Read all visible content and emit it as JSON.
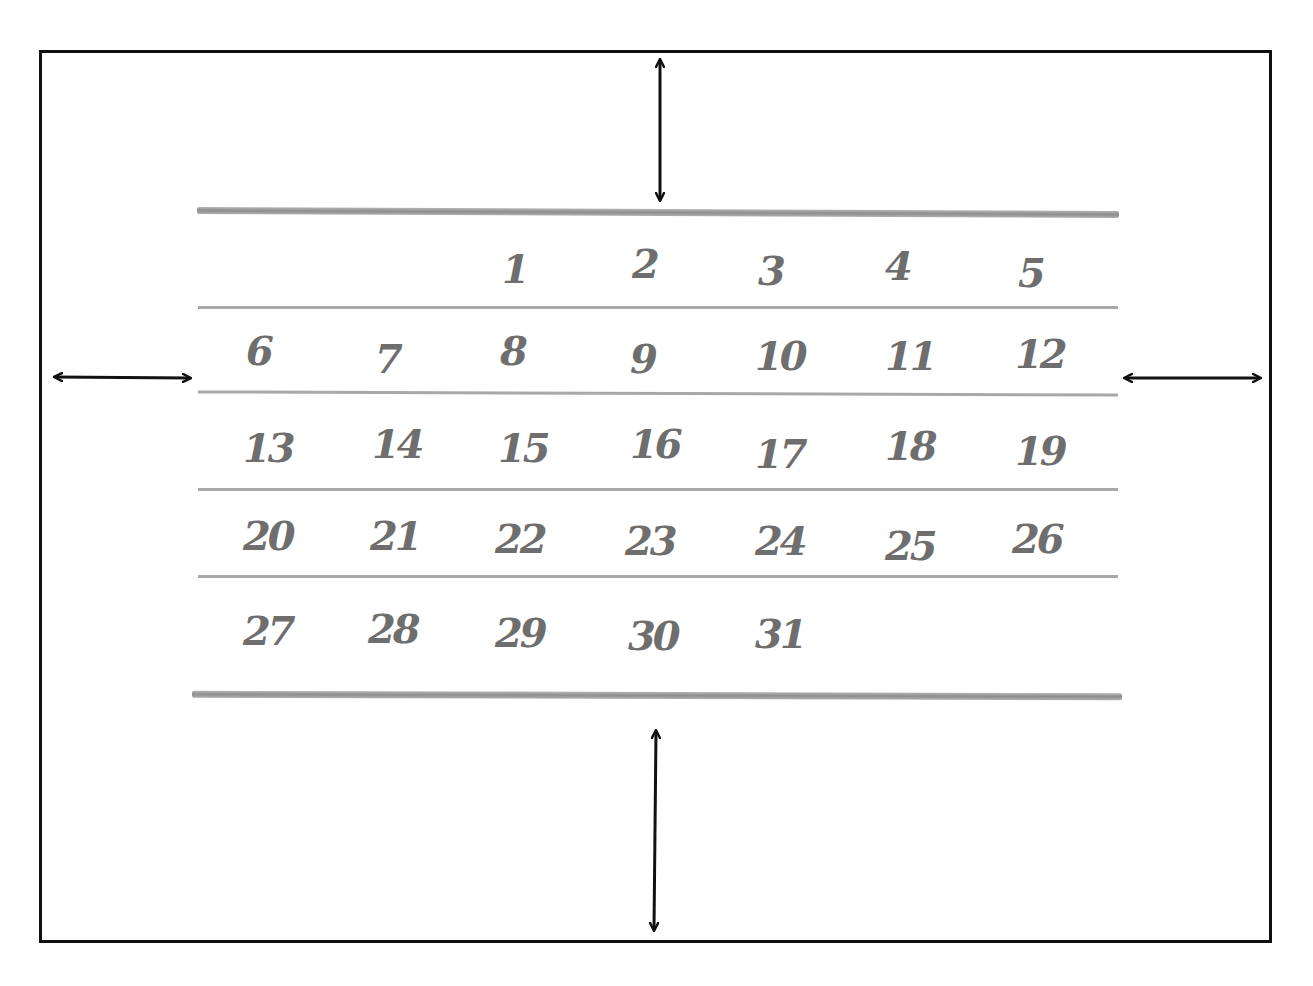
{
  "diagram": {
    "title": "",
    "colors": {
      "frame": "#111111",
      "rules": "#9a9a9a",
      "numerals": "#6e6e6e",
      "arrows": "#111111"
    },
    "calendar": {
      "columns": 7,
      "rows": [
        [
          "",
          "",
          "1",
          "2",
          "3",
          "4",
          "5"
        ],
        [
          "6",
          "7",
          "8",
          "9",
          "10",
          "11",
          "12"
        ],
        [
          "13",
          "14",
          "15",
          "16",
          "17",
          "18",
          "19"
        ],
        [
          "20",
          "21",
          "22",
          "23",
          "24",
          "25",
          "26"
        ],
        [
          "27",
          "28",
          "29",
          "30",
          "31",
          "",
          ""
        ]
      ]
    },
    "arrows": [
      {
        "name": "top-margin-arrow",
        "direction": "vertical"
      },
      {
        "name": "bottom-margin-arrow",
        "direction": "vertical"
      },
      {
        "name": "left-margin-arrow",
        "direction": "horizontal"
      },
      {
        "name": "right-margin-arrow",
        "direction": "horizontal"
      }
    ]
  }
}
